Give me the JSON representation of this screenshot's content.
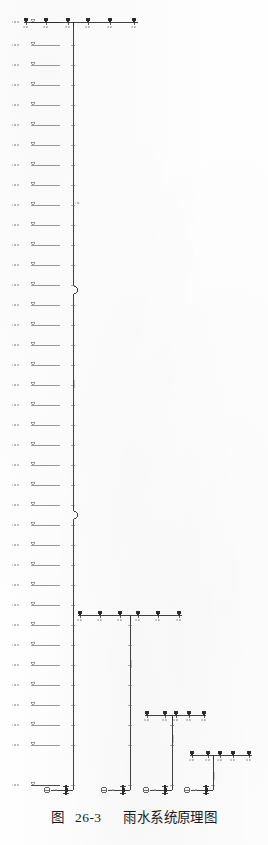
{
  "figure": {
    "caption_prefix": "图",
    "caption_number": "26-3",
    "caption_title": "雨水系统原理图",
    "caption_full": "图 26-3  雨水系统原理图",
    "drawing_type": "schematic-riser-diagram",
    "discipline": "雨水 (stormwater / rainwater)"
  },
  "style": {
    "paper": "#ffffff",
    "ink": "#2b2b2b",
    "ink_light": "#6e6e6e",
    "ink_faint": "#9a9a9a",
    "text": "#1a1a1a"
  },
  "canvas": {
    "width": 268,
    "height": 845
  },
  "chart_data": {
    "type": "diagram",
    "xlabel": "",
    "ylabel": "标高 (elevation)",
    "grid": false,
    "legend": "none"
  },
  "elevation_ladder": {
    "name": "floor-elevation-ladder",
    "x_label": 12,
    "x_tick": 33,
    "x_line_start": 36,
    "x_line_end": 60,
    "note": "each row = one storey; label text is an elevation value, illegible at scan resolution",
    "rows": [
      {
        "y": 22,
        "label": "XX.XX",
        "roof": true
      },
      {
        "y": 45,
        "label": "XX.XX"
      },
      {
        "y": 65,
        "label": "XX.XX"
      },
      {
        "y": 85,
        "label": "XX.XX"
      },
      {
        "y": 105,
        "label": "XX.XX"
      },
      {
        "y": 125,
        "label": "XX.XX"
      },
      {
        "y": 145,
        "label": "XX.XX"
      },
      {
        "y": 165,
        "label": "XX.XX"
      },
      {
        "y": 185,
        "label": "XX.XX"
      },
      {
        "y": 205,
        "label": "XX.XX"
      },
      {
        "y": 225,
        "label": "XX.XX"
      },
      {
        "y": 245,
        "label": "XX.XX"
      },
      {
        "y": 265,
        "label": "XX.XX"
      },
      {
        "y": 285,
        "label": "XX.XX"
      },
      {
        "y": 305,
        "label": "XX.XX"
      },
      {
        "y": 325,
        "label": "XX.XX"
      },
      {
        "y": 345,
        "label": "XX.XX"
      },
      {
        "y": 365,
        "label": "XX.XX"
      },
      {
        "y": 385,
        "label": "XX.XX"
      },
      {
        "y": 405,
        "label": "XX.XX"
      },
      {
        "y": 425,
        "label": "XX.XX"
      },
      {
        "y": 445,
        "label": "XX.XX"
      },
      {
        "y": 465,
        "label": "XX.XX"
      },
      {
        "y": 485,
        "label": "XX.XX"
      },
      {
        "y": 505,
        "label": "XX.XX"
      },
      {
        "y": 525,
        "label": "XX.XX"
      },
      {
        "y": 545,
        "label": "XX.XX"
      },
      {
        "y": 565,
        "label": "XX.XX"
      },
      {
        "y": 585,
        "label": "XX.XX"
      },
      {
        "y": 605,
        "label": "XX.XX"
      },
      {
        "y": 625,
        "label": "XX.XX"
      },
      {
        "y": 645,
        "label": "XX.XX"
      },
      {
        "y": 665,
        "label": "XX.XX"
      },
      {
        "y": 685,
        "label": "XX.XX"
      },
      {
        "y": 705,
        "label": "XX.XX"
      },
      {
        "y": 725,
        "label": "XX.XX"
      },
      {
        "y": 745,
        "label": "XX.XX"
      },
      {
        "y": 785,
        "label": "XX.XX",
        "ground": true
      }
    ]
  },
  "risers": [
    {
      "id": "riser-1",
      "name": "rainwater-stack-1",
      "x": 73,
      "top_y": 22,
      "base_y": 790,
      "label": "YL-1",
      "jogs": [
        {
          "y": 290,
          "dx": 5
        },
        {
          "y": 515,
          "dx": 5
        }
      ],
      "branch": {
        "y": 22,
        "x_start": 24,
        "x_end": 138,
        "drain_count": 6,
        "drains": [
          {
            "x": 26,
            "label": "DN100"
          },
          {
            "x": 46,
            "label": "DN100"
          },
          {
            "x": 68,
            "label": "DN100"
          },
          {
            "x": 88,
            "label": "DN100"
          },
          {
            "x": 110,
            "label": "DN100"
          },
          {
            "x": 134,
            "label": "DN100"
          }
        ]
      },
      "base": {
        "cleanout_x": 47,
        "valve_x": 66,
        "ground_y": 790
      }
    },
    {
      "id": "riser-2",
      "name": "rainwater-stack-2",
      "x": 130,
      "top_y": 615,
      "base_y": 790,
      "label": "YL-2",
      "jogs": [],
      "branch": {
        "y": 615,
        "x_start": 78,
        "x_end": 182,
        "drain_count": 6,
        "drains": [
          {
            "x": 80,
            "label": "DN100"
          },
          {
            "x": 100,
            "label": "DN100"
          },
          {
            "x": 120,
            "label": "DN100"
          },
          {
            "x": 138,
            "label": "DN100"
          },
          {
            "x": 158,
            "label": "DN100"
          },
          {
            "x": 179,
            "label": "DN100"
          }
        ]
      },
      "base": {
        "cleanout_x": 104,
        "valve_x": 123,
        "ground_y": 790
      }
    },
    {
      "id": "riser-3",
      "name": "rainwater-stack-3",
      "x": 172,
      "top_y": 715,
      "base_y": 790,
      "label": "YL-3",
      "jogs": [],
      "branch": {
        "y": 715,
        "x_start": 145,
        "x_end": 206,
        "drain_count": 5,
        "drains": [
          {
            "x": 147,
            "label": "DN100"
          },
          {
            "x": 165,
            "label": "DN100"
          },
          {
            "x": 176,
            "label": "DN100"
          },
          {
            "x": 189,
            "label": "DN100"
          },
          {
            "x": 204,
            "label": "DN100"
          }
        ]
      },
      "base": {
        "cleanout_x": 146,
        "valve_x": 165,
        "ground_y": 790
      }
    },
    {
      "id": "riser-4",
      "name": "rainwater-stack-4",
      "x": 213,
      "top_y": 755,
      "base_y": 790,
      "label": "YL-4",
      "jogs": [],
      "branch": {
        "y": 755,
        "x_start": 190,
        "x_end": 252,
        "drain_count": 5,
        "drains": [
          {
            "x": 192,
            "label": "DN100"
          },
          {
            "x": 208,
            "label": "DN100"
          },
          {
            "x": 220,
            "label": "DN100"
          },
          {
            "x": 233,
            "label": "DN100"
          },
          {
            "x": 249,
            "label": "DN100"
          }
        ]
      },
      "base": {
        "cleanout_x": 187,
        "valve_x": 206,
        "ground_y": 790
      }
    }
  ],
  "symbols": {
    "roof_drain": "雨水斗 (roof drain)",
    "cleanout": "检查口 (cleanout)",
    "valve": "阀门 (valve)",
    "floor_line": "楼层线 (floor line)",
    "elevation_tick": "标高符号 (elevation mark)"
  }
}
